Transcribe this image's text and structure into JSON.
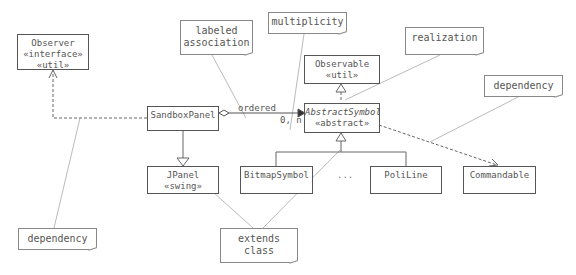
{
  "diagram": {
    "type": "UML class diagram",
    "classes": [
      {
        "id": "observer",
        "name": "Observer",
        "stereotypes": [
          "«interface»",
          "«util»"
        ]
      },
      {
        "id": "sandboxpanel",
        "name": "SandboxPanel",
        "stereotypes": []
      },
      {
        "id": "jpanel",
        "name": "JPanel",
        "stereotypes": [
          "«swing»"
        ]
      },
      {
        "id": "observable",
        "name": "Observable",
        "stereotypes": [
          "«util»"
        ]
      },
      {
        "id": "abstractsymbol",
        "name": "AbstractSymbol",
        "stereotypes": [
          "«abstract»"
        ],
        "italic": true
      },
      {
        "id": "bitmapsymbol",
        "name": "BitmapSymbol",
        "stereotypes": []
      },
      {
        "id": "poliline",
        "name": "PoliLine",
        "stereotypes": []
      },
      {
        "id": "commandable",
        "name": "Commandable",
        "stereotypes": []
      }
    ],
    "ellipsis": "...",
    "association": {
      "from": "SandboxPanel",
      "to": "AbstractSymbol",
      "label": "ordered",
      "multiplicity": "0, n",
      "kind": "aggregation"
    },
    "notes": [
      {
        "id": "note-labeled-association",
        "lines": [
          "labeled",
          "association"
        ]
      },
      {
        "id": "note-multiplicity",
        "lines": [
          "multiplicity"
        ]
      },
      {
        "id": "note-realization",
        "lines": [
          "realization"
        ]
      },
      {
        "id": "note-dependency-right",
        "lines": [
          "dependency"
        ]
      },
      {
        "id": "note-dependency-left",
        "lines": [
          "dependency"
        ]
      },
      {
        "id": "note-extends-class",
        "lines": [
          "extends",
          "class"
        ]
      }
    ],
    "relationships": [
      {
        "from": "SandboxPanel",
        "to": "Observer",
        "type": "dependency"
      },
      {
        "from": "SandboxPanel",
        "to": "JPanel",
        "type": "generalization"
      },
      {
        "from": "AbstractSymbol",
        "to": "Observable",
        "type": "realization"
      },
      {
        "from": "BitmapSymbol",
        "to": "AbstractSymbol",
        "type": "generalization"
      },
      {
        "from": "PoliLine",
        "to": "AbstractSymbol",
        "type": "generalization"
      },
      {
        "from": "AbstractSymbol",
        "to": "Commandable",
        "type": "dependency"
      },
      {
        "from": "SandboxPanel",
        "to": "AbstractSymbol",
        "type": "aggregation"
      }
    ]
  }
}
